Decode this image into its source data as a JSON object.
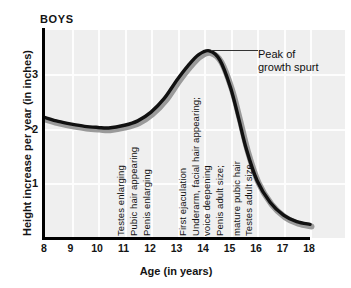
{
  "chart_data": {
    "type": "line",
    "title": "BOYS",
    "xlabel": "Age (in years)",
    "ylabel": "Height increase per year (in inches)",
    "xlim": [
      8,
      18
    ],
    "ylim": [
      0,
      3.8
    ],
    "grid": true,
    "legend": "none",
    "x_ticks": [
      "8",
      "9",
      "10",
      "11",
      "12",
      "13",
      "14",
      "15",
      "16",
      "17",
      "18"
    ],
    "y_ticks": [
      "3",
      "2",
      "1"
    ],
    "x": [
      8,
      8.5,
      9,
      9.5,
      10,
      10.4,
      11,
      11.5,
      12,
      12.5,
      13,
      13.4,
      13.8,
      14.2,
      14.6,
      15,
      15.3,
      15.6,
      16,
      16.5,
      17,
      17.5,
      18
    ],
    "values": [
      2.2,
      2.13,
      2.08,
      2.04,
      2.02,
      2.01,
      2.06,
      2.14,
      2.3,
      2.55,
      2.9,
      3.15,
      3.35,
      3.42,
      3.25,
      2.75,
      2.2,
      1.62,
      1.05,
      0.65,
      0.42,
      0.3,
      0.25
    ],
    "series": [
      {
        "name": "Height increase per year",
        "values": [
          2.2,
          2.13,
          2.08,
          2.04,
          2.02,
          2.01,
          2.06,
          2.14,
          2.3,
          2.55,
          2.9,
          3.15,
          3.35,
          3.42,
          3.25,
          2.75,
          2.2,
          1.62,
          1.05,
          0.65,
          0.42,
          0.3,
          0.25
        ]
      }
    ],
    "annotations": [
      {
        "text": "Testes enlarging",
        "age": 11.05
      },
      {
        "text": "Pubic hair appearing",
        "age": 11.55
      },
      {
        "text": "Penis enlarging",
        "age": 12.05
      },
      {
        "text": "First ejaculation",
        "age": 13.4
      },
      {
        "text": "Underarm, facial hair appearing;",
        "age": 13.87
      },
      {
        "text": "voice deepening",
        "age": 14.3
      },
      {
        "text": "Penis adult size;",
        "age": 14.78
      },
      {
        "text": "mature pubic hair",
        "age": 15.45
      },
      {
        "text": "Testes adult size",
        "age": 15.9
      }
    ],
    "callout": {
      "line1": "Peak of",
      "line2": "growth spurt",
      "points_to_age": 14.2,
      "points_to_value": 3.42
    },
    "colors": {
      "curve": "#111111",
      "curve_shadow": "#999999",
      "plot_background": "#efefef",
      "gridline": "#fdfdfd",
      "axis": "#000000",
      "text": "#141414"
    }
  }
}
